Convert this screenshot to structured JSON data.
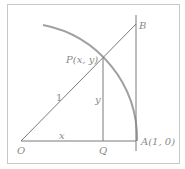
{
  "diagram": {
    "title": "",
    "colors": {
      "line": "#7a7a7a",
      "arc": "#a0a0a0",
      "frame": "#c8c8c8",
      "label": "#8a8a8a"
    },
    "points": {
      "O": {
        "label": "O",
        "x": 0,
        "y": 0
      },
      "Q": {
        "label": "Q",
        "x": "x",
        "y": 0
      },
      "A": {
        "label": "A(1, 0)",
        "x": 1,
        "y": 0
      },
      "P": {
        "label": "P(x, y)",
        "x": "x",
        "y": "y"
      },
      "B": {
        "label": "B"
      }
    },
    "segment_labels": {
      "OP": "1",
      "OQ": "x",
      "PQ": "y"
    },
    "elements": [
      "unit circle arc from top to A(1, 0)",
      "segment O to B through P",
      "segment O to A",
      "vertical segment P to Q",
      "tangent line at A through B"
    ]
  }
}
